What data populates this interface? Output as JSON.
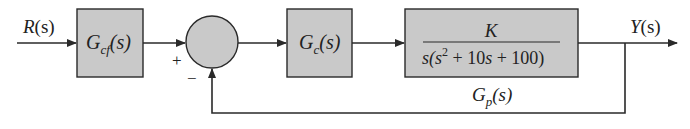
{
  "diagram": {
    "type": "block-diagram",
    "title": "",
    "colors": {
      "block_fill": "#c9c9c9",
      "line": "#2a2a2a",
      "background": "#ffffff"
    },
    "input": {
      "label": "R(s)",
      "label_main": "R",
      "label_arg": "(s)"
    },
    "output": {
      "label": "Y(s)",
      "label_main": "Y",
      "label_arg": "(s)"
    },
    "blocks": [
      {
        "id": "Gcf",
        "label": "Gcf(s)",
        "main": "G",
        "sub": "cf",
        "arg": "(s)"
      },
      {
        "id": "Gc",
        "label": "Gc(s)",
        "main": "G",
        "sub": "c",
        "arg": "(s)"
      },
      {
        "id": "plant",
        "label": "K / s(s^2 + 10s + 100)",
        "numerator": "K",
        "den_a": "s(s",
        "den_exp": "2",
        "den_b": " + 10",
        "den_s": "s",
        "den_c": " + 100)"
      }
    ],
    "summing_junction": {
      "plus_sign": "+",
      "minus_sign": "−"
    },
    "plant_caption": {
      "label": "Gp(s)",
      "main": "G",
      "sub": "p",
      "arg": "(s)"
    }
  }
}
